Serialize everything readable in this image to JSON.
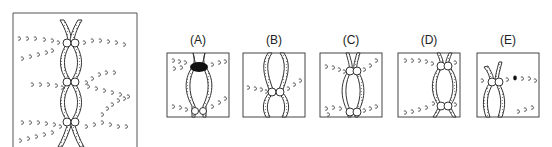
{
  "figure": {
    "main_panel": {
      "description": "Metaphase chromosome pair with chiasmata and spindle fibers"
    },
    "options": [
      {
        "label": "(A)"
      },
      {
        "label": "(B)"
      },
      {
        "label": "(C)"
      },
      {
        "label": "(D)"
      },
      {
        "label": "(E)"
      }
    ]
  },
  "colors": {
    "line": "#333333",
    "background": "#ffffff",
    "fill_dark": "#111111"
  }
}
